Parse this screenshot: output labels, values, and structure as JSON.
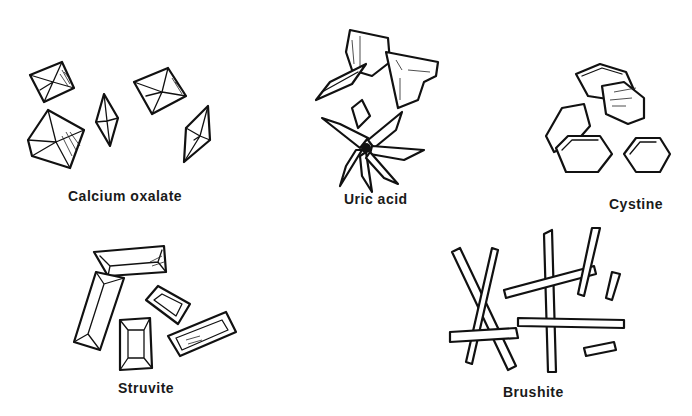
{
  "figure": {
    "groups": [
      {
        "id": "calcium-oxalate",
        "label": "Calcium oxalate",
        "shape": "octahedral envelope crystals"
      },
      {
        "id": "uric-acid",
        "label": "Uric acid",
        "shape": "rhomboid plates and rosettes"
      },
      {
        "id": "cystine",
        "label": "Cystine",
        "shape": "hexagonal plates"
      },
      {
        "id": "struvite",
        "label": "Struvite",
        "shape": "coffin-lid prisms"
      },
      {
        "id": "brushite",
        "label": "Brushite",
        "shape": "needle/rod prisms"
      }
    ]
  }
}
